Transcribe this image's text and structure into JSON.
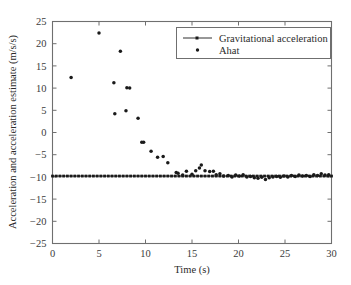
{
  "chart_data": {
    "type": "scatter",
    "title": "",
    "xlabel": "Time (s)",
    "ylabel": "Acceleration and acceleration estimate (m/s/s)",
    "xlim": [
      0,
      30
    ],
    "ylim": [
      -25,
      25
    ],
    "xticks": [
      0,
      5,
      10,
      15,
      20,
      25,
      30
    ],
    "yticks": [
      -25,
      -20,
      -15,
      -10,
      -5,
      0,
      5,
      10,
      15,
      20,
      25
    ],
    "xtick_labels": [
      "0",
      "5",
      "10",
      "15",
      "20",
      "25",
      "30"
    ],
    "ytick_labels": [
      "-25",
      "-20",
      "-15",
      "-10",
      "-5",
      "0",
      "5",
      "10",
      "15",
      "20",
      "25"
    ],
    "grid": false,
    "legend_position": "upper right",
    "series": [
      {
        "name": "Gravitational acceleration",
        "marker": "square-dot",
        "style": "line-with-markers",
        "color": "#1a1a1a",
        "x": [
          0.0,
          0.4,
          0.8,
          1.2,
          1.6,
          2.0,
          2.4,
          2.8,
          3.2,
          3.6,
          4.0,
          4.4,
          4.8,
          5.2,
          5.6,
          6.0,
          6.4,
          6.8,
          7.2,
          7.6,
          8.0,
          8.4,
          8.8,
          9.2,
          9.6,
          10.0,
          10.4,
          10.8,
          11.2,
          11.6,
          12.0,
          12.4,
          12.8,
          13.2,
          13.6,
          14.0,
          14.4,
          14.8,
          15.2,
          15.6,
          16.0,
          16.4,
          16.8,
          17.2,
          17.6,
          18.0,
          18.4,
          18.8,
          19.2,
          19.6,
          20.0,
          20.4,
          20.8,
          21.2,
          21.6,
          22.0,
          22.4,
          22.8,
          23.2,
          23.6,
          24.0,
          24.4,
          24.8,
          25.2,
          25.6,
          26.0,
          26.4,
          26.8,
          27.2,
          27.6,
          28.0,
          28.4,
          28.8,
          29.2,
          29.6,
          30.0
        ],
        "y": [
          -9.81,
          -9.81,
          -9.81,
          -9.81,
          -9.81,
          -9.81,
          -9.81,
          -9.81,
          -9.81,
          -9.81,
          -9.81,
          -9.81,
          -9.81,
          -9.81,
          -9.81,
          -9.81,
          -9.81,
          -9.81,
          -9.81,
          -9.81,
          -9.81,
          -9.81,
          -9.81,
          -9.81,
          -9.81,
          -9.81,
          -9.81,
          -9.81,
          -9.81,
          -9.81,
          -9.81,
          -9.81,
          -9.81,
          -9.81,
          -9.81,
          -9.81,
          -9.81,
          -9.81,
          -9.81,
          -9.81,
          -9.81,
          -9.81,
          -9.81,
          -9.81,
          -9.81,
          -9.81,
          -9.81,
          -9.81,
          -9.81,
          -9.81,
          -9.81,
          -9.81,
          -9.81,
          -9.81,
          -9.81,
          -9.81,
          -9.81,
          -9.81,
          -9.81,
          -9.81,
          -9.81,
          -9.81,
          -9.81,
          -9.81,
          -9.81,
          -9.81,
          -9.81,
          -9.81,
          -9.81,
          -9.81,
          -9.81,
          -9.81,
          -9.81,
          -9.81,
          -9.81,
          -9.81
        ]
      },
      {
        "name": "Ahat",
        "marker": "dot",
        "style": "markers-only",
        "color": "#1a1a1a",
        "x": [
          2.0,
          5.0,
          6.6,
          6.7,
          7.3,
          7.9,
          8.0,
          8.3,
          9.2,
          9.6,
          9.8,
          10.6,
          11.3,
          11.9,
          12.4,
          13.3,
          13.5,
          14.0,
          14.4,
          15.0,
          15.4,
          15.8,
          16.0,
          16.4,
          16.9,
          17.3,
          17.6,
          18.0,
          18.4,
          18.9,
          19.3,
          19.7,
          20.1,
          20.5,
          20.9,
          21.3,
          21.7,
          22.1,
          22.5,
          22.9,
          23.3,
          23.7,
          24.1,
          24.5,
          24.9,
          25.3,
          25.7,
          26.1,
          26.5,
          26.9,
          27.3,
          27.7,
          28.1,
          28.5,
          28.9,
          29.3,
          29.7
        ],
        "y": [
          12.4,
          22.4,
          11.2,
          4.2,
          18.3,
          4.9,
          10.1,
          10.0,
          3.2,
          -2.2,
          -2.2,
          -4.2,
          -5.6,
          -5.4,
          -6.8,
          -9.0,
          -9.2,
          -9.6,
          -8.7,
          -9.4,
          -8.6,
          -8.0,
          -7.3,
          -8.6,
          -8.8,
          -8.7,
          -9.5,
          -9.3,
          -9.8,
          -9.7,
          -10.0,
          -9.6,
          -9.8,
          -9.5,
          -10.0,
          -9.9,
          -10.2,
          -10.3,
          -10.1,
          -10.6,
          -10.2,
          -10.0,
          -9.9,
          -10.1,
          -9.8,
          -10.0,
          -9.7,
          -9.9,
          -9.6,
          -9.8,
          -9.7,
          -9.9,
          -9.5,
          -9.7,
          -9.3,
          -9.6,
          -9.5
        ]
      }
    ]
  },
  "legend": {
    "entries": [
      {
        "label": "Gravitational acceleration"
      },
      {
        "label": "Ahat"
      }
    ]
  }
}
